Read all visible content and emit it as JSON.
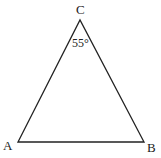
{
  "diagram": {
    "type": "triangle",
    "stroke_color": "#222222",
    "background": "#ffffff",
    "vertices": {
      "A": {
        "label": "A",
        "x": 18,
        "y": 142
      },
      "B": {
        "label": "B",
        "x": 144,
        "y": 142
      },
      "C": {
        "label": "C",
        "x": 80,
        "y": 20
      }
    },
    "angle_annotation": {
      "vertex": "C",
      "label": "55°"
    }
  }
}
